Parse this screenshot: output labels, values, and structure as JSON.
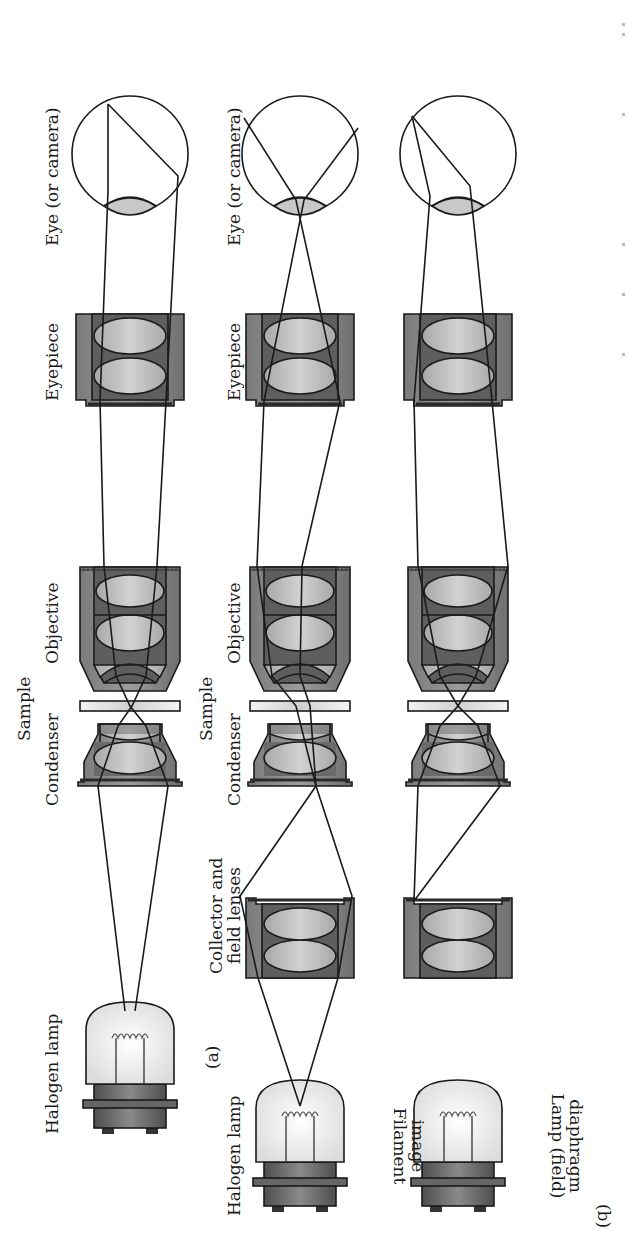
{
  "figure": {
    "panels": [
      {
        "id": "a",
        "label": "(a)",
        "components": {
          "lamp": "Halogen lamp",
          "condenser": "Condenser",
          "sample": "Sample",
          "objective": "Objective",
          "eyepiece": "Eyepiece",
          "eye": "Eye (or camera)"
        }
      },
      {
        "id": "b",
        "label": "(b)",
        "components": {
          "lamp": "Halogen lamp",
          "collector": "Collector and",
          "collector2": "field lenses",
          "condenser": "Condenser",
          "sample": "Sample",
          "objective": "Objective",
          "eyepiece": "Eyepiece",
          "eye": "Eye (or camera)"
        },
        "row_labels": [
          {
            "line1": "Filament",
            "line2": "image"
          },
          {
            "line1": "Lamp (field)",
            "line2": "diaphragm"
          }
        ]
      }
    ],
    "colors": {
      "housing": "#9a9a9a",
      "housing_dark": "#5a5a5a",
      "lens": "#c4c4c4",
      "lamp_base": "#6a6a6a",
      "bulb": "#eeeeee",
      "ray": "#1a1a1a"
    }
  }
}
